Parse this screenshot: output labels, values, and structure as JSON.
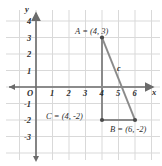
{
  "figure": {
    "kind": "coordinate-plane-right-triangle",
    "background_color": "#ffffff",
    "grid_color": "#d8d8d8",
    "axis_color": "#6b6b6b",
    "triangle_color": "#8a8a8a",
    "text_color": "#2e2e2e"
  },
  "axes": {
    "x_axis_name": "x",
    "y_axis_name": "y",
    "origin_label": "O",
    "x_ticks": [
      "1",
      "2",
      "3",
      "4",
      "5",
      "6"
    ],
    "y_ticks": [
      "4",
      "3",
      "2",
      "1",
      "-1",
      "-2",
      "-3"
    ],
    "x_range": [
      -1,
      7
    ],
    "y_range": [
      -3.5,
      4.5
    ]
  },
  "points": [
    {
      "name": "A",
      "label": "A = (4, 3)",
      "x": 4,
      "y": 3
    },
    {
      "name": "B",
      "label": "B = (6, -2)",
      "x": 6,
      "y": -2
    },
    {
      "name": "C",
      "label": "C = (4, -2)",
      "x": 4,
      "y": -2
    }
  ],
  "sides": [
    {
      "name": "c",
      "label": "c",
      "from": "A",
      "to": "B"
    }
  ]
}
